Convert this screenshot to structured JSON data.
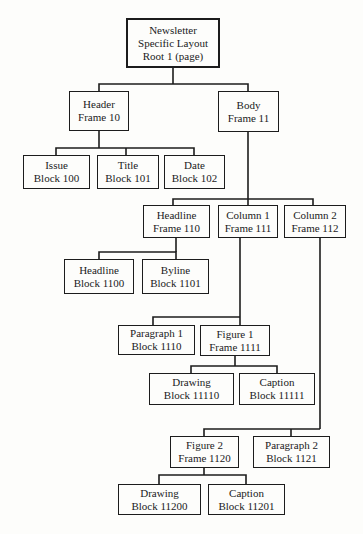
{
  "page": {
    "background_color": "#fdfdfb",
    "ink_color": "#1c1c1c",
    "figure_type": "layout-structure-tree"
  },
  "diagram": {
    "type": "tree",
    "nodes": {
      "root": {
        "lines": [
          "Newsletter",
          "Specific Layout",
          "Root 1 (page)"
        ]
      },
      "header": {
        "lines": [
          "Header",
          "Frame 10"
        ]
      },
      "body": {
        "lines": [
          "Body",
          "Frame 11"
        ]
      },
      "issue": {
        "lines": [
          "Issue",
          "Block 100"
        ]
      },
      "title": {
        "lines": [
          "Title",
          "Block 101"
        ]
      },
      "date": {
        "lines": [
          "Date",
          "Block 102"
        ]
      },
      "headline_frame": {
        "lines": [
          "Headline",
          "Frame 110"
        ]
      },
      "column1": {
        "lines": [
          "Column 1",
          "Frame 111"
        ]
      },
      "column2": {
        "lines": [
          "Column 2",
          "Frame 112"
        ]
      },
      "headline_block": {
        "lines": [
          "Headline",
          "Block 1100"
        ]
      },
      "byline": {
        "lines": [
          "Byline",
          "Block 1101"
        ]
      },
      "paragraph1": {
        "lines": [
          "Paragraph 1",
          "Block 1110"
        ]
      },
      "figure1": {
        "lines": [
          "Figure 1",
          "Frame 1111"
        ]
      },
      "drawing1": {
        "lines": [
          "Drawing",
          "Block 11110"
        ]
      },
      "caption1": {
        "lines": [
          "Caption",
          "Block 11111"
        ]
      },
      "figure2": {
        "lines": [
          "Figure 2",
          "Frame 1120"
        ]
      },
      "paragraph2": {
        "lines": [
          "Paragraph 2",
          "Block 1121"
        ]
      },
      "drawing2": {
        "lines": [
          "Drawing",
          "Block 11200"
        ]
      },
      "caption2": {
        "lines": [
          "Caption",
          "Block 11201"
        ]
      }
    },
    "edges": [
      [
        "root",
        "header"
      ],
      [
        "root",
        "body"
      ],
      [
        "header",
        "issue"
      ],
      [
        "header",
        "title"
      ],
      [
        "header",
        "date"
      ],
      [
        "body",
        "headline_frame"
      ],
      [
        "body",
        "column1"
      ],
      [
        "body",
        "column2"
      ],
      [
        "headline_frame",
        "headline_block"
      ],
      [
        "headline_frame",
        "byline"
      ],
      [
        "column1",
        "paragraph1"
      ],
      [
        "column1",
        "figure1"
      ],
      [
        "figure1",
        "drawing1"
      ],
      [
        "figure1",
        "caption1"
      ],
      [
        "column2",
        "figure2"
      ],
      [
        "column2",
        "paragraph2"
      ],
      [
        "figure2",
        "drawing2"
      ],
      [
        "figure2",
        "caption2"
      ]
    ]
  }
}
